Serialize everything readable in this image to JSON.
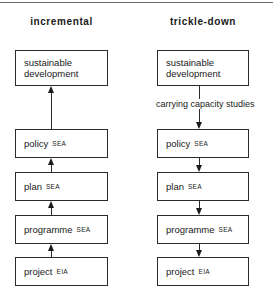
{
  "columns": [
    {
      "title": "incremental",
      "direction": "up",
      "boxes": [
        {
          "label": "sustainable development",
          "line1": "sustainable",
          "line2": "development",
          "abbr": ""
        },
        {
          "label": "policy",
          "abbr": "SEA"
        },
        {
          "label": "plan",
          "abbr": "SEA"
        },
        {
          "label": "programme",
          "abbr": "SEA"
        },
        {
          "label": "project",
          "abbr": "EIA"
        }
      ]
    },
    {
      "title": "trickle-down",
      "direction": "down",
      "edge_label": "carrying capacity studies",
      "boxes": [
        {
          "label": "sustainable development",
          "line1": "sustainable",
          "line2": "development",
          "abbr": ""
        },
        {
          "label": "policy",
          "abbr": "SEA"
        },
        {
          "label": "plan",
          "abbr": "SEA"
        },
        {
          "label": "programme",
          "abbr": "SEA"
        },
        {
          "label": "project",
          "abbr": "EIA"
        }
      ]
    }
  ]
}
